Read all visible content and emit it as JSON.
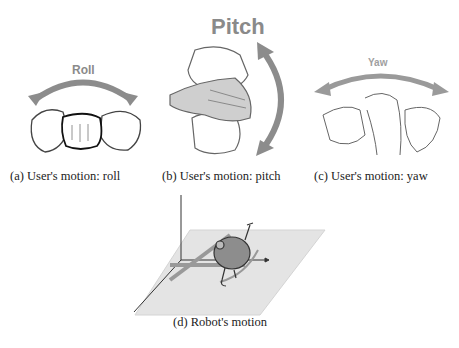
{
  "panels": [
    {
      "id": "a",
      "motion_label": "Roll",
      "caption": "(a) User's motion: roll"
    },
    {
      "id": "b",
      "motion_label": "Pitch",
      "caption": "(b) User's motion: pitch"
    },
    {
      "id": "c",
      "motion_label": "Yaw",
      "caption": "(c) User's motion: yaw"
    },
    {
      "id": "d",
      "caption": "(d) Robot's motion"
    }
  ],
  "colors": {
    "arrow": "#8c8c8c",
    "outline": "#333333",
    "plane": "#e4e4e4"
  }
}
